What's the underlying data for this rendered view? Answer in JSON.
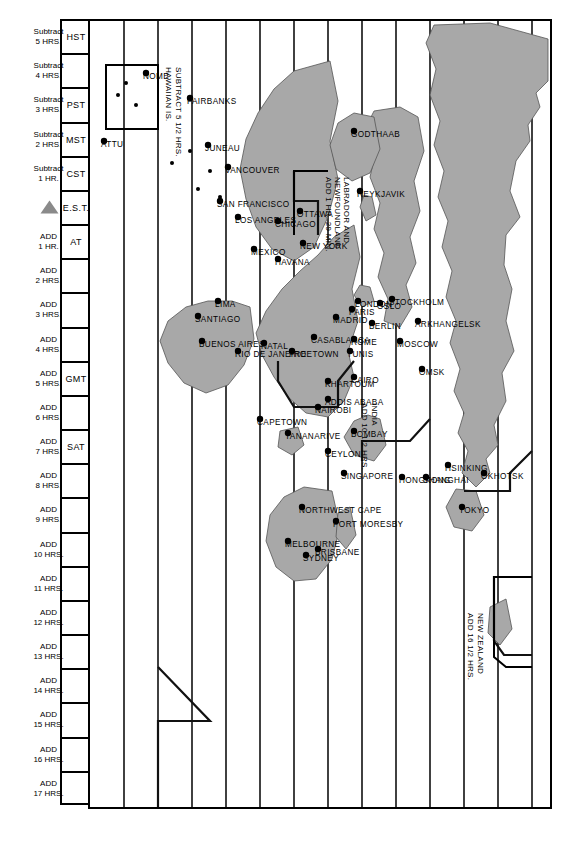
{
  "map": {
    "title": "Standard Time Zones of the World",
    "orientation_deg": 90,
    "land_color": "#a8a8a8",
    "line_color": "#111111",
    "background": "#ffffff"
  },
  "zone_columns": {
    "abbrev_row": [
      {
        "key": "HST",
        "label": "HST"
      },
      {
        "key": "z-10",
        "label": ""
      },
      {
        "key": "PST",
        "label": "PST"
      },
      {
        "key": "MST",
        "label": "MST"
      },
      {
        "key": "CST",
        "label": "CST"
      },
      {
        "key": "EST",
        "label": "E.S.T."
      },
      {
        "key": "AT",
        "label": "AT"
      },
      {
        "key": "p2",
        "label": ""
      },
      {
        "key": "p3",
        "label": ""
      },
      {
        "key": "p4",
        "label": ""
      },
      {
        "key": "GMT",
        "label": "GMT"
      },
      {
        "key": "p6",
        "label": ""
      },
      {
        "key": "SAT",
        "label": "SAT"
      },
      {
        "key": "p8",
        "label": ""
      },
      {
        "key": "p9",
        "label": ""
      },
      {
        "key": "p10",
        "label": ""
      },
      {
        "key": "p11",
        "label": ""
      },
      {
        "key": "p12",
        "label": ""
      },
      {
        "key": "p13",
        "label": ""
      },
      {
        "key": "p14",
        "label": ""
      },
      {
        "key": "p15",
        "label": ""
      },
      {
        "key": "p16",
        "label": ""
      },
      {
        "key": "p17",
        "label": ""
      }
    ],
    "offsets": [
      {
        "top": "Subtract",
        "bottom": "5 HRS."
      },
      {
        "top": "Subtract",
        "bottom": "4 HRS."
      },
      {
        "top": "Subtract",
        "bottom": "3 HRS."
      },
      {
        "top": "Subtract",
        "bottom": "2 HRS."
      },
      {
        "top": "Subtract",
        "bottom": "1 HR."
      },
      {
        "top": "",
        "bottom": ""
      },
      {
        "top": "ADD",
        "bottom": "1 HR."
      },
      {
        "top": "ADD",
        "bottom": "2 HRS."
      },
      {
        "top": "ADD",
        "bottom": "3 HRS."
      },
      {
        "top": "ADD",
        "bottom": "4 HRS."
      },
      {
        "top": "ADD",
        "bottom": "5 HRS."
      },
      {
        "top": "ADD",
        "bottom": "6 HRS."
      },
      {
        "top": "ADD",
        "bottom": "7 HRS."
      },
      {
        "top": "ADD",
        "bottom": "8 HRS."
      },
      {
        "top": "ADD",
        "bottom": "9 HRS."
      },
      {
        "top": "ADD",
        "bottom": "10 HRS."
      },
      {
        "top": "ADD",
        "bottom": "11 HRS."
      },
      {
        "top": "ADD",
        "bottom": "12 HRS."
      },
      {
        "top": "ADD",
        "bottom": "13 HRS."
      },
      {
        "top": "ADD",
        "bottom": "14 HRS."
      },
      {
        "top": "ADD",
        "bottom": "15 HRS."
      },
      {
        "top": "ADD",
        "bottom": "16 HRS."
      },
      {
        "top": "ADD",
        "bottom": "17 HRS."
      }
    ],
    "daylight_note": "FOR DAYLIGHT SAVING, SUBTRACT 1 HOUR",
    "est_marker": "triangle-pointer"
  },
  "cities": [
    {
      "name": "NOME",
      "x": 52,
      "y": 404
    },
    {
      "name": "ATTU",
      "x": 120,
      "y": 446
    },
    {
      "name": "FAIRBANKS",
      "x": 77,
      "y": 360
    },
    {
      "name": "JUNEAU",
      "x": 124,
      "y": 342
    },
    {
      "name": "VANCOUVER",
      "x": 146,
      "y": 322
    },
    {
      "name": "SAN FRANCISCO",
      "x": 180,
      "y": 330
    },
    {
      "name": "LOS ANGELES",
      "x": 196,
      "y": 312
    },
    {
      "name": "GODTHAAB",
      "x": 110,
      "y": 196
    },
    {
      "name": "OTTAWA",
      "x": 190,
      "y": 250
    },
    {
      "name": "CHICAGO",
      "x": 200,
      "y": 272
    },
    {
      "name": "NEW YORK",
      "x": 222,
      "y": 247
    },
    {
      "name": "MEXICO",
      "x": 228,
      "y": 296
    },
    {
      "name": "HAVANA",
      "x": 238,
      "y": 272
    },
    {
      "name": "LIMA",
      "x": 280,
      "y": 332
    },
    {
      "name": "SANTIAGO",
      "x": 295,
      "y": 352
    },
    {
      "name": "BUENOS AIRES",
      "x": 320,
      "y": 348
    },
    {
      "name": "RIO DE JANEIRO",
      "x": 330,
      "y": 312
    },
    {
      "name": "NATAL",
      "x": 322,
      "y": 286
    },
    {
      "name": "REYKJAVIK",
      "x": 170,
      "y": 190
    },
    {
      "name": "FREETOWN",
      "x": 330,
      "y": 258
    },
    {
      "name": "CASABLANCA",
      "x": 316,
      "y": 236
    },
    {
      "name": "MADRID",
      "x": 296,
      "y": 214
    },
    {
      "name": "LONDON",
      "x": 280,
      "y": 192
    },
    {
      "name": "PARIS",
      "x": 288,
      "y": 198
    },
    {
      "name": "OSLO",
      "x": 282,
      "y": 170
    },
    {
      "name": "STOCKHOLM",
      "x": 278,
      "y": 158
    },
    {
      "name": "BERLIN",
      "x": 302,
      "y": 178
    },
    {
      "name": "ROME",
      "x": 318,
      "y": 196
    },
    {
      "name": "TUNIS",
      "x": 330,
      "y": 200
    },
    {
      "name": "CAIRO",
      "x": 356,
      "y": 196
    },
    {
      "name": "KHARTOUM",
      "x": 360,
      "y": 222
    },
    {
      "name": "ADDIS ABABA",
      "x": 378,
      "y": 222
    },
    {
      "name": "NAIROBI",
      "x": 386,
      "y": 232
    },
    {
      "name": "CAPETOWN",
      "x": 398,
      "y": 290
    },
    {
      "name": "TANANARIVE",
      "x": 412,
      "y": 262
    },
    {
      "name": "MOSCOW",
      "x": 320,
      "y": 150
    },
    {
      "name": "ARKHANGELSK",
      "x": 300,
      "y": 132
    },
    {
      "name": "OMSK",
      "x": 348,
      "y": 128
    },
    {
      "name": "BOMBAY",
      "x": 410,
      "y": 196
    },
    {
      "name": "CEYLON",
      "x": 430,
      "y": 222
    },
    {
      "name": "SINGAPORE",
      "x": 452,
      "y": 206
    },
    {
      "name": "HONGKONG",
      "x": 456,
      "y": 148
    },
    {
      "name": "SHANGHAI",
      "x": 456,
      "y": 124
    },
    {
      "name": "HSINKING",
      "x": 444,
      "y": 102
    },
    {
      "name": "TOKYO",
      "x": 486,
      "y": 88
    },
    {
      "name": "OKHOTSK",
      "x": 452,
      "y": 66
    },
    {
      "name": "PORT MORESBY",
      "x": 500,
      "y": 214
    },
    {
      "name": "NORTHWEST CAPE",
      "x": 486,
      "y": 248
    },
    {
      "name": "BRISBANE",
      "x": 528,
      "y": 232
    },
    {
      "name": "SYDNEY",
      "x": 534,
      "y": 244
    },
    {
      "name": "MELBOURNE",
      "x": 520,
      "y": 262
    }
  ],
  "annotations": [
    {
      "id": "new-zealand",
      "lines": [
        "NEW ZEALAND",
        "ADD 16 1/2 HRS."
      ]
    },
    {
      "id": "india",
      "lines": [
        "INDIA",
        "ADD 10 1/2 HRS."
      ]
    },
    {
      "id": "labrador",
      "lines": [
        "LABRADOR AND",
        "NEWFOUNDLAND",
        "ADD 1 HR. 29 MIN."
      ]
    },
    {
      "id": "hawaii",
      "lines": [
        "HAWAIIAN IS.",
        "SUBTRACT 5 1/2 HRS."
      ]
    }
  ]
}
